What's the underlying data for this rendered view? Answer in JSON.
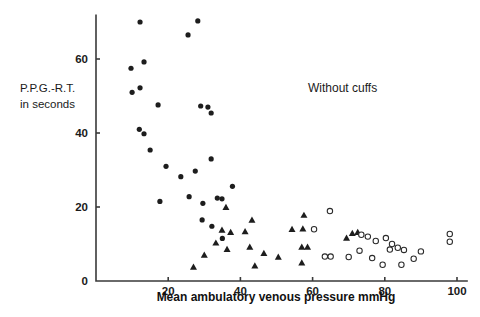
{
  "chart_data": {
    "type": "scatter",
    "title": "",
    "annotation": "Without cuffs",
    "xlabel": "Mean ambulatory venous pressure   mmHg",
    "ylabel_line1": "P.P.G.-R.T.",
    "ylabel_line2": "in seconds",
    "xlim": [
      0,
      103
    ],
    "ylim": [
      0,
      72
    ],
    "xticks": [
      20,
      40,
      60,
      80,
      100
    ],
    "xtick_labels": [
      "20",
      "40",
      "60",
      "80",
      "100"
    ],
    "yticks": [
      0,
      20,
      40,
      60
    ],
    "ytick_labels": [
      "0",
      "20",
      "40",
      "60"
    ],
    "grid": false,
    "legend": "none",
    "series": [
      {
        "name": "filled-circle",
        "marker": "filled circle",
        "color": "#1d1d1d",
        "points": [
          [
            12.2,
            70.0
          ],
          [
            28.2,
            70.3
          ],
          [
            25.5,
            66.5
          ],
          [
            9.7,
            57.5
          ],
          [
            13.3,
            59.2
          ],
          [
            12.2,
            52.2
          ],
          [
            10.0,
            51.0
          ],
          [
            17.2,
            47.6
          ],
          [
            29.0,
            47.3
          ],
          [
            31.0,
            47.0
          ],
          [
            31.9,
            45.4
          ],
          [
            12.0,
            41.0
          ],
          [
            13.3,
            39.8
          ],
          [
            15.0,
            35.4
          ],
          [
            19.4,
            31.0
          ],
          [
            23.5,
            28.2
          ],
          [
            27.5,
            29.7
          ],
          [
            31.9,
            33.0
          ],
          [
            25.8,
            22.8
          ],
          [
            29.6,
            21.0
          ],
          [
            33.6,
            22.4
          ],
          [
            17.7,
            21.5
          ],
          [
            37.8,
            25.6
          ],
          [
            29.4,
            16.5
          ],
          [
            32.1,
            14.8
          ],
          [
            35.0,
            11.5
          ],
          [
            34.9,
            22.2
          ]
        ]
      },
      {
        "name": "filled-triangle",
        "marker": "filled triangle",
        "color": "#1d1d1d",
        "points": [
          [
            36.0,
            19.9
          ],
          [
            43.2,
            16.5
          ],
          [
            34.9,
            13.8
          ],
          [
            37.3,
            13.2
          ],
          [
            41.3,
            13.4
          ],
          [
            33.2,
            10.3
          ],
          [
            36.3,
            8.6
          ],
          [
            42.6,
            9.2
          ],
          [
            46.5,
            7.5
          ],
          [
            57.6,
            17.8
          ],
          [
            54.3,
            14.0
          ],
          [
            57.3,
            14.1
          ],
          [
            57.0,
            9.2
          ],
          [
            58.6,
            9.2
          ],
          [
            57.0,
            4.9
          ],
          [
            71.0,
            12.9
          ],
          [
            72.5,
            13.2
          ],
          [
            69.4,
            11.6
          ],
          [
            30.0,
            7.0
          ],
          [
            27.0,
            3.8
          ],
          [
            44.0,
            4.1
          ],
          [
            50.5,
            6.5
          ]
        ]
      },
      {
        "name": "open-circle",
        "marker": "open circle",
        "color": "#ffffff",
        "points": [
          [
            64.8,
            18.9
          ],
          [
            60.4,
            14.0
          ],
          [
            73.5,
            12.5
          ],
          [
            75.3,
            12.0
          ],
          [
            77.5,
            10.8
          ],
          [
            80.3,
            11.6
          ],
          [
            82.0,
            10.0
          ],
          [
            81.4,
            8.5
          ],
          [
            83.6,
            9.0
          ],
          [
            85.3,
            8.4
          ],
          [
            70.0,
            6.5
          ],
          [
            79.4,
            4.4
          ],
          [
            84.6,
            4.4
          ],
          [
            63.4,
            6.6
          ],
          [
            65.0,
            6.6
          ],
          [
            76.5,
            6.2
          ],
          [
            98.0,
            12.7
          ],
          [
            98.0,
            10.6
          ],
          [
            73.0,
            8.2
          ],
          [
            90.0,
            8.0
          ],
          [
            88.0,
            6.0
          ]
        ]
      }
    ]
  },
  "axes": {
    "x_origin_px": 96,
    "y_origin_px": 281
  }
}
